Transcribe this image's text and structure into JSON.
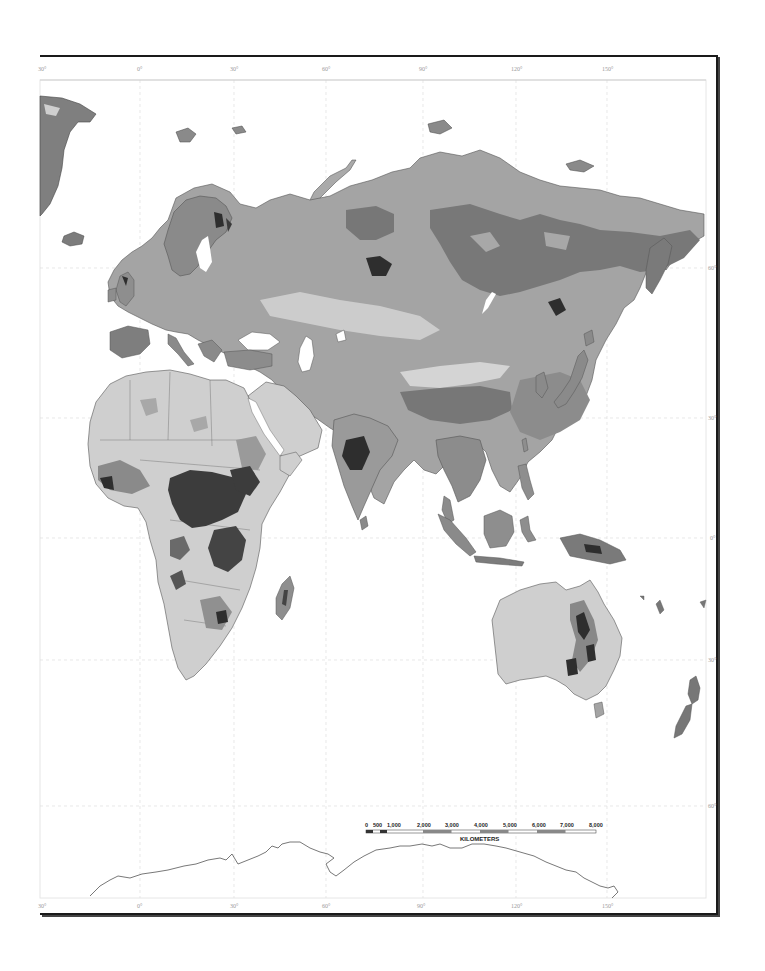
{
  "map": {
    "type": "thematic world map (Eastern Hemisphere, grayscale land classification)",
    "longitude_labels_top": [
      "30°",
      "0°",
      "30°",
      "60°",
      "90°",
      "120°",
      "150°"
    ],
    "longitude_labels_bottom": [
      "30°",
      "0°",
      "30°",
      "60°",
      "90°",
      "120°",
      "150°"
    ],
    "latitude_labels_right": [
      "60°",
      "30°",
      "0°",
      "30°",
      "60°"
    ],
    "regions_shown": [
      "Greenland",
      "Europe",
      "Africa",
      "Madagascar",
      "Arabian Peninsula",
      "Asia",
      "India",
      "Southeast Asia",
      "Japan",
      "Indonesia",
      "New Guinea",
      "Australia",
      "Tasmania",
      "New Zealand",
      "Antarctica (coastline)"
    ],
    "colors": {
      "water": "#ffffff",
      "land_light": "#d2d2d2",
      "land_mid": "#a8a8a8",
      "land_dark": "#7a7a7a",
      "land_darkest": "#2e2e2e",
      "border": "#555555",
      "frame": "#1a1a1a",
      "graticule": "#dcdcdc"
    }
  },
  "scale_bar": {
    "ticks": [
      "0",
      "500",
      "1,000",
      "2,000",
      "3,000",
      "4,000",
      "5,000",
      "6,000",
      "7,000",
      "8,000"
    ],
    "unit_label": "KILOMETERS"
  }
}
